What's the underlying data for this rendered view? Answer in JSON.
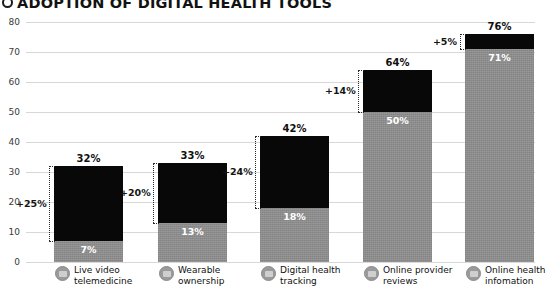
{
  "title": {
    "bullet_icon": "circle-bullet-icon",
    "text": "ADOPTION OF DIGITAL HEALTH TOOLS"
  },
  "chart_data": {
    "type": "bar",
    "title": "ADOPTION OF DIGITAL HEALTH TOOLS",
    "xlabel": "",
    "ylabel": "",
    "ylim": [
      0,
      80
    ],
    "yticks": [
      0,
      10,
      20,
      30,
      40,
      50,
      60,
      70,
      80
    ],
    "ytick_labels": [
      "0",
      "10",
      "20",
      "30",
      "40",
      "50",
      "60",
      "70",
      "80"
    ],
    "grid": true,
    "legend": "none",
    "stacked": true,
    "categories": [
      "Live video telemedicine",
      "Wearable ownership",
      "Digital health tracking",
      "Online provider reviews",
      "Online health infomation"
    ],
    "series": [
      {
        "name": "Baseline",
        "values": [
          7,
          13,
          18,
          50,
          71
        ]
      },
      {
        "name": "Growth",
        "values": [
          25,
          20,
          24,
          14,
          5
        ]
      }
    ],
    "totals": [
      32,
      33,
      42,
      64,
      76
    ],
    "total_labels": [
      "32%",
      "33%",
      "42%",
      "64%",
      "76%"
    ],
    "base_labels": [
      "7%",
      "13%",
      "18%",
      "50%",
      "71%"
    ],
    "growth_labels": [
      "+25%",
      "+20%",
      "+24%",
      "+14%",
      "+5%"
    ],
    "colors": {
      "growth": "#080808",
      "baseline": "#8c8c8c",
      "grid": "#d8d8d8",
      "text": "#111111",
      "base_label_text": "#ffffff"
    }
  },
  "categories": [
    {
      "icon": "video-camera-icon",
      "line1": "Live video",
      "line2": "telemedicine"
    },
    {
      "icon": "smartwatch-icon",
      "line1": "Wearable",
      "line2": "ownership"
    },
    {
      "icon": "activity-app-icon",
      "line1": "Digital health",
      "line2": "tracking"
    },
    {
      "icon": "star-review-icon",
      "line1": "Online provider",
      "line2": "reviews"
    },
    {
      "icon": "browser-info-icon",
      "line1": "Online health",
      "line2": "infomation"
    }
  ]
}
